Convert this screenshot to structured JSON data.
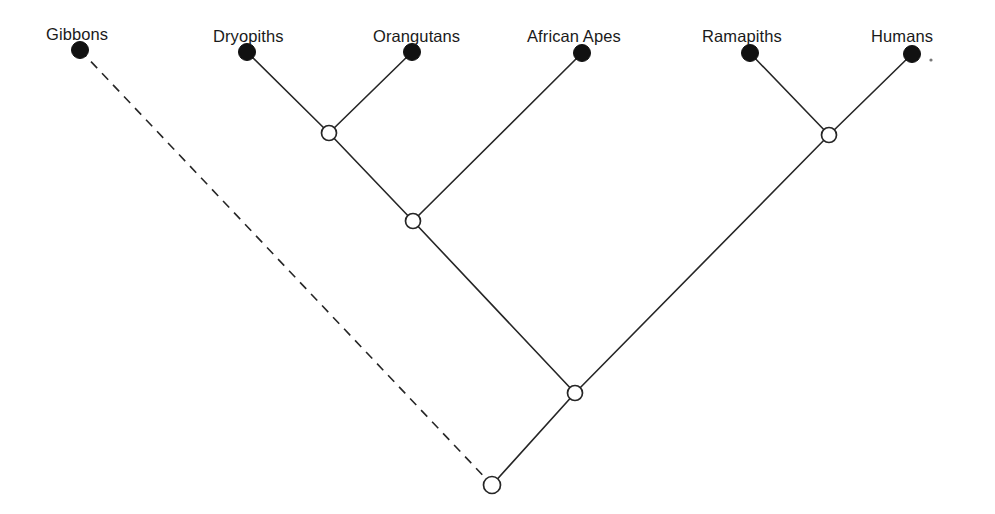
{
  "figure": {
    "kind": "cladogram",
    "background_color": "#ffffff",
    "line_color": "#262626",
    "terminal_node_color": "#111111",
    "internal_node_fill": "#ffffff"
  },
  "taxa": [
    {
      "id": "gibbons",
      "label": "Gibbons",
      "label_x": 46,
      "label_y": 40,
      "node_x": 80,
      "node_y": 50,
      "node_r": 8.5,
      "node_style": "filled"
    },
    {
      "id": "dryopiths",
      "label": "Dryopiths",
      "label_x": 213,
      "label_y": 42,
      "node_x": 247,
      "node_y": 52,
      "node_r": 8.5,
      "node_style": "filled"
    },
    {
      "id": "orangutans",
      "label": "Orangutans",
      "label_x": 373,
      "label_y": 42,
      "node_x": 412,
      "node_y": 52,
      "node_r": 8.5,
      "node_style": "filled"
    },
    {
      "id": "african-apes",
      "label": "African Apes",
      "label_x": 527,
      "label_y": 42,
      "node_x": 582,
      "node_y": 53,
      "node_r": 8.5,
      "node_style": "filled"
    },
    {
      "id": "ramapiths",
      "label": "Ramapiths",
      "label_x": 702,
      "label_y": 42,
      "node_x": 750,
      "node_y": 53,
      "node_r": 8.5,
      "node_style": "filled"
    },
    {
      "id": "humans",
      "label": "Humans",
      "label_x": 871,
      "label_y": 42,
      "node_x": 912,
      "node_y": 54,
      "node_r": 8.5,
      "node_style": "filled"
    }
  ],
  "internal_nodes": [
    {
      "id": "node-dryopith-orangutan",
      "x": 329,
      "y": 133,
      "r": 7.5,
      "node_style": "open",
      "children": [
        "dryopiths",
        "orangutans"
      ]
    },
    {
      "id": "node-great-ape-asian",
      "x": 413,
      "y": 221,
      "r": 7.5,
      "node_style": "open",
      "children": [
        "node-dryopith-orangutan",
        "african-apes"
      ]
    },
    {
      "id": "node-ramapith-human",
      "x": 829,
      "y": 135,
      "r": 7.5,
      "node_style": "open",
      "children": [
        "ramapiths",
        "humans"
      ]
    },
    {
      "id": "node-hominid",
      "x": 575,
      "y": 393,
      "r": 7.5,
      "node_style": "open",
      "children": [
        "node-great-ape-asian",
        "node-ramapith-human"
      ]
    },
    {
      "id": "node-root",
      "x": 492,
      "y": 485,
      "r": 8.5,
      "node_style": "open",
      "children": [
        "gibbons",
        "node-hominid"
      ]
    }
  ],
  "branches": [
    {
      "id": "branch-dryopiths",
      "from": [
        247,
        52
      ],
      "to": [
        329,
        133
      ],
      "style": "solid"
    },
    {
      "id": "branch-orangutans",
      "from": [
        412,
        52
      ],
      "to": [
        329,
        133
      ],
      "style": "solid"
    },
    {
      "id": "branch-asian-clade",
      "from": [
        329,
        133
      ],
      "to": [
        413,
        221
      ],
      "style": "solid"
    },
    {
      "id": "branch-african-apes",
      "from": [
        582,
        53
      ],
      "to": [
        413,
        221
      ],
      "style": "solid"
    },
    {
      "id": "branch-great-ape",
      "from": [
        413,
        221
      ],
      "to": [
        575,
        393
      ],
      "style": "solid"
    },
    {
      "id": "branch-ramapiths",
      "from": [
        750,
        53
      ],
      "to": [
        829,
        135
      ],
      "style": "solid"
    },
    {
      "id": "branch-humans",
      "from": [
        912,
        54
      ],
      "to": [
        829,
        135
      ],
      "style": "solid"
    },
    {
      "id": "branch-human-clade",
      "from": [
        829,
        135
      ],
      "to": [
        575,
        393
      ],
      "style": "solid"
    },
    {
      "id": "branch-hominid-root",
      "from": [
        575,
        393
      ],
      "to": [
        492,
        485
      ],
      "style": "solid"
    },
    {
      "id": "branch-gibbons",
      "from": [
        80,
        50
      ],
      "to": [
        492,
        485
      ],
      "style": "dashed"
    }
  ],
  "artifacts": [
    {
      "id": "speck-near-humans",
      "x": 931,
      "y": 60,
      "r": 1.6
    }
  ]
}
